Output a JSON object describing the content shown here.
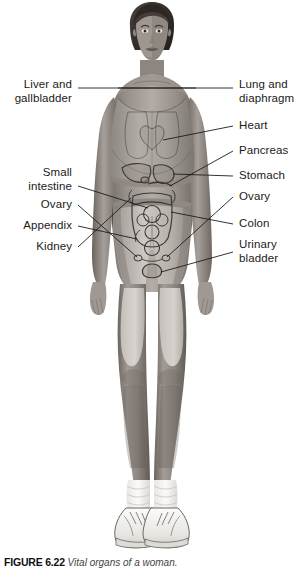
{
  "figure": {
    "caption_number": "FIGURE 6.22",
    "caption_text": "Vital organs of a woman.",
    "background_color": "#ffffff",
    "ink_color": "#1a1a1a"
  },
  "subject": {
    "name": "female-anatomy-figure",
    "pose": "standing-front-view",
    "clothing": [
      "sports-bra",
      "shorts",
      "socks",
      "sneakers"
    ]
  },
  "labels": {
    "left": [
      {
        "id": "liver-gallbladder",
        "text": "Liver and\ngallbladder",
        "x": 72,
        "y": 78,
        "leader": {
          "x1": 76,
          "y1": 88,
          "x2": 196,
          "y2": 88
        }
      },
      {
        "id": "small-intestine",
        "text": "Small\nintestine",
        "x": 72,
        "y": 166,
        "leader": {
          "x1": 76,
          "y1": 186,
          "x2": 152,
          "y2": 200
        }
      },
      {
        "id": "ovary-left",
        "text": "Ovary",
        "x": 72,
        "y": 198,
        "leader": {
          "x1": 76,
          "y1": 205,
          "x2": 148,
          "y2": 212
        }
      },
      {
        "id": "appendix",
        "text": "Appendix",
        "x": 72,
        "y": 219,
        "leader": {
          "x1": 76,
          "y1": 226,
          "x2": 150,
          "y2": 222
        }
      },
      {
        "id": "kidney",
        "text": "Kidney",
        "x": 72,
        "y": 240,
        "leader": {
          "x1": 76,
          "y1": 247,
          "x2": 160,
          "y2": 230
        }
      }
    ],
    "right": [
      {
        "id": "lung-diaphragm",
        "text": "Lung and\ndiaphragm",
        "x": 239,
        "y": 78,
        "leader": {
          "x1": 235,
          "y1": 88,
          "x2": 112,
          "y2": 88
        }
      },
      {
        "id": "heart",
        "text": "Heart",
        "x": 239,
        "y": 119,
        "leader": {
          "x1": 235,
          "y1": 126,
          "x2": 166,
          "y2": 145
        }
      },
      {
        "id": "pancreas",
        "text": "Pancreas",
        "x": 239,
        "y": 144,
        "leader": {
          "x1": 235,
          "y1": 151,
          "x2": 156,
          "y2": 174
        }
      },
      {
        "id": "stomach",
        "text": "Stomach",
        "x": 239,
        "y": 169,
        "leader": {
          "x1": 235,
          "y1": 176,
          "x2": 150,
          "y2": 178
        }
      },
      {
        "id": "ovary-right",
        "text": "Ovary",
        "x": 239,
        "y": 190,
        "leader": {
          "x1": 235,
          "y1": 197,
          "x2": 172,
          "y2": 214
        }
      },
      {
        "id": "colon",
        "text": "Colon",
        "x": 239,
        "y": 217,
        "leader": {
          "x1": 235,
          "y1": 224,
          "x2": 170,
          "y2": 233
        }
      },
      {
        "id": "urinary-bladder",
        "text": "Urinary\nbladder",
        "x": 239,
        "y": 238,
        "leader": {
          "x1": 235,
          "y1": 252,
          "x2": 166,
          "y2": 262
        }
      }
    ]
  },
  "organs": [
    {
      "id": "liver-shape",
      "label": "liver"
    },
    {
      "id": "stomach-shape",
      "label": "stomach"
    },
    {
      "id": "pancreas-shape",
      "label": "pancreas"
    },
    {
      "id": "small-intestine-shape",
      "label": "small intestine"
    },
    {
      "id": "colon-shape",
      "label": "colon"
    },
    {
      "id": "kidney-shape",
      "label": "kidney"
    },
    {
      "id": "ovary-shape",
      "label": "ovary"
    },
    {
      "id": "bladder-shape",
      "label": "urinary bladder"
    },
    {
      "id": "appendix-shape",
      "label": "appendix"
    },
    {
      "id": "heart-shape",
      "label": "heart"
    },
    {
      "id": "lung-shape",
      "label": "lung and diaphragm"
    }
  ],
  "colors": {
    "skin_light": "#b9b2ad",
    "skin_mid": "#8e8782",
    "skin_shadow": "#6e6762",
    "hair": "#3a3330",
    "garment_light": "#d8d4d0",
    "garment_mid": "#a8a29c",
    "shoe_white": "#f2f1ef",
    "outline": "#2b2b2b"
  }
}
